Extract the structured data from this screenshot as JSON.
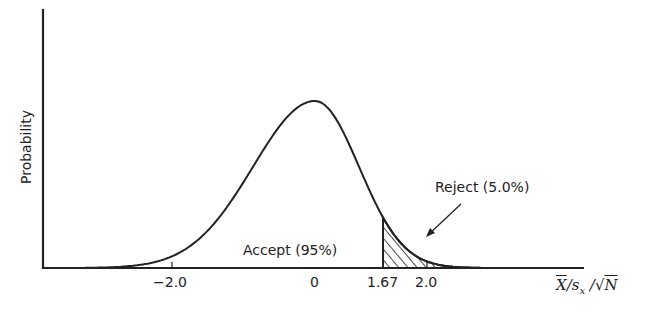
{
  "chart_data": {
    "type": "area",
    "title": "",
    "xlabel": "X̄/sₓ/√N",
    "ylabel": "Probability",
    "distribution": "normal (one-tailed test)",
    "x_ticks": [
      {
        "value": -2.0,
        "label": "−2.0"
      },
      {
        "value": 0,
        "label": "0"
      },
      {
        "value": 1.67,
        "label": "1.67"
      },
      {
        "value": 2.0,
        "label": "2.0"
      }
    ],
    "critical_value": 1.67,
    "regions": [
      {
        "name": "Accept",
        "label": "Accept (95%)",
        "percent": 95,
        "range": [
          -4,
          1.67
        ],
        "shaded": false
      },
      {
        "name": "Reject",
        "label": "Reject (5.0%)",
        "percent": 5.0,
        "range": [
          1.67,
          4
        ],
        "shaded": true,
        "pattern": "diagonal hatch"
      }
    ],
    "grid": false,
    "legend": "none"
  },
  "labels": {
    "ylabel": "Probability",
    "accept": "Accept (95%)",
    "reject": "Reject (5.0%)",
    "tick_neg2": "−2.0",
    "tick_0": "0",
    "tick_167": "1.67",
    "tick_2": "2.0"
  },
  "colors": {
    "ink": "#222222",
    "background": "#ffffff"
  }
}
